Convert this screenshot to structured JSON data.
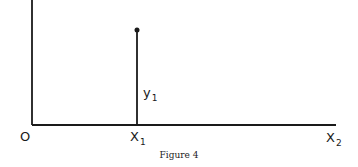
{
  "figure": {
    "caption": "Figure 4",
    "origin_label": "O",
    "x1_label": {
      "main": "X",
      "sub": "1"
    },
    "x2_label": {
      "main": "X",
      "sub": "2"
    },
    "y1_label": {
      "main": "y",
      "sub": "1"
    },
    "line_color": "#1a1a1a",
    "point": {
      "x": 137,
      "y": 30
    }
  }
}
